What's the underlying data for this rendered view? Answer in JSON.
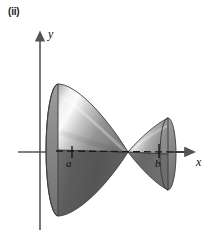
{
  "figure": {
    "part_label": "(ii)",
    "background_color": "#ffffff",
    "axis_color": "#555555",
    "solid_color_light": "#f2f2f2",
    "solid_color_mid": "#9a9a9a",
    "solid_color_dark": "#4a4a4a",
    "outline_color": "#3a3a3a"
  },
  "axes": {
    "y_label": "y",
    "x_label": "x",
    "origin": {
      "x": 40,
      "y": 152
    },
    "x_axis_from": {
      "x": 18,
      "y": 152
    },
    "x_axis_to": {
      "x": 192,
      "y": 152
    },
    "y_axis_from": {
      "x": 40,
      "y": 230
    },
    "y_axis_to": {
      "x": 40,
      "y": 34
    },
    "arrowheads": [
      "x-positive",
      "y-positive"
    ]
  },
  "ticks": [
    {
      "label": "a",
      "x": 72,
      "y": 152
    },
    {
      "label": "b",
      "x": 159,
      "y": 152
    }
  ],
  "solids": {
    "description": "two cones (nappes) meeting at a common apex on the x-axis, axis of revolution along x",
    "apex": {
      "x": 128,
      "y": 152
    },
    "left_cone": {
      "base_center": {
        "x": 58,
        "y": 150
      },
      "base_rx": 12,
      "base_ry": 66,
      "contains_tick": "a"
    },
    "right_cone": {
      "base_center": {
        "x": 168,
        "y": 154
      },
      "base_rx": 8,
      "base_ry": 36,
      "contains_tick": "b"
    },
    "axis_of_revolution": {
      "style": "dashed",
      "from": {
        "x": 58,
        "y": 151
      },
      "to": {
        "x": 178,
        "y": 152
      }
    }
  }
}
